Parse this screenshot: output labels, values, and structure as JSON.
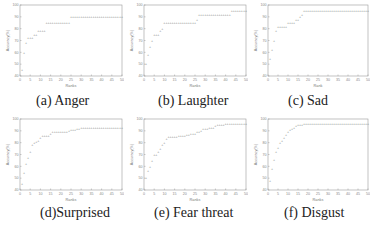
{
  "captions": {
    "a": "(a) Anger",
    "b": "(b) Laughter",
    "c": "(c) Sad",
    "d": "(d)Surprised",
    "e": "(e) Fear threat",
    "f": "(f) Disgust"
  },
  "chart_data": [
    {
      "id": "a",
      "type": "scatter",
      "title": "(a) Anger",
      "xlabel": "Ranks",
      "ylabel": "Accuracy(%)",
      "xlim": [
        0,
        50
      ],
      "ylim": [
        40,
        100
      ],
      "x": [
        1,
        2,
        3,
        4,
        5,
        6,
        7,
        8,
        9,
        10,
        11,
        12,
        13,
        14,
        15,
        16,
        17,
        18,
        19,
        20,
        21,
        22,
        23,
        24,
        25,
        26,
        27,
        28,
        29,
        30,
        31,
        32,
        33,
        34,
        35,
        36,
        37,
        38,
        39,
        40,
        41,
        42,
        43,
        44,
        45,
        46,
        47,
        48,
        49,
        50
      ],
      "values": [
        45,
        60,
        68,
        72,
        72,
        72,
        75,
        75,
        78,
        78,
        78,
        78,
        85,
        85,
        85,
        85,
        85,
        85,
        85,
        85,
        85,
        85,
        85,
        85,
        90,
        90,
        90,
        90,
        90,
        90,
        90,
        90,
        90,
        90,
        90,
        90,
        90,
        90,
        90,
        90,
        90,
        90,
        90,
        90,
        90,
        90,
        90,
        90,
        90,
        90
      ],
      "grid": false
    },
    {
      "id": "b",
      "type": "scatter",
      "title": "(b) Laughter",
      "xlabel": "Ranks",
      "ylabel": "Accuracy(%)",
      "xlim": [
        0,
        50
      ],
      "ylim": [
        40,
        100
      ],
      "x": [
        1,
        2,
        3,
        4,
        5,
        6,
        7,
        8,
        9,
        10,
        11,
        12,
        13,
        14,
        15,
        16,
        17,
        18,
        19,
        20,
        21,
        22,
        23,
        24,
        25,
        26,
        27,
        28,
        29,
        30,
        31,
        32,
        33,
        34,
        35,
        36,
        37,
        38,
        39,
        40,
        41,
        42,
        43,
        44,
        45,
        46,
        47,
        48,
        49,
        50
      ],
      "values": [
        50,
        58,
        65,
        70,
        75,
        75,
        75,
        78,
        80,
        85,
        85,
        85,
        85,
        85,
        85,
        85,
        85,
        85,
        85,
        85,
        85,
        85,
        85,
        85,
        85,
        88,
        92,
        92,
        92,
        92,
        92,
        92,
        92,
        92,
        92,
        92,
        92,
        92,
        92,
        92,
        92,
        92,
        95,
        95,
        95,
        95,
        95,
        95,
        95,
        95
      ],
      "grid": false
    },
    {
      "id": "c",
      "type": "scatter",
      "title": "(c) Sad",
      "xlabel": "Rank",
      "ylabel": "Accuracy(%)",
      "xlim": [
        0,
        50
      ],
      "ylim": [
        40,
        100
      ],
      "x": [
        1,
        2,
        3,
        4,
        5,
        6,
        7,
        8,
        9,
        10,
        11,
        12,
        13,
        14,
        15,
        16,
        17,
        18,
        19,
        20,
        21,
        22,
        23,
        24,
        25,
        26,
        27,
        28,
        29,
        30,
        31,
        32,
        33,
        34,
        35,
        36,
        37,
        38,
        39,
        40,
        41,
        42,
        43,
        44,
        45,
        46,
        47,
        48,
        49,
        50
      ],
      "values": [
        55,
        62,
        70,
        78,
        82,
        82,
        82,
        82,
        82,
        85,
        85,
        85,
        85,
        88,
        88,
        90,
        92,
        95,
        95,
        95,
        95,
        95,
        95,
        95,
        95,
        95,
        95,
        95,
        95,
        95,
        95,
        95,
        95,
        95,
        95,
        95,
        95,
        95,
        95,
        95,
        95,
        95,
        95,
        95,
        95,
        95,
        95,
        95,
        95,
        95
      ],
      "grid": false
    },
    {
      "id": "d",
      "type": "scatter",
      "title": "(d)Surprised",
      "xlabel": "Ranks",
      "ylabel": "Accuracy(%)",
      "xlim": [
        0,
        50
      ],
      "ylim": [
        40,
        100
      ],
      "xticks": [
        0,
        5,
        10,
        15,
        20,
        25,
        30,
        35,
        40,
        45,
        50
      ],
      "yticks": [
        40,
        50,
        60,
        70,
        80,
        90,
        100
      ],
      "x": [
        1,
        2,
        3,
        4,
        5,
        6,
        7,
        8,
        9,
        10,
        11,
        12,
        13,
        14,
        15,
        16,
        17,
        18,
        19,
        20,
        21,
        22,
        23,
        24,
        25,
        26,
        27,
        28,
        29,
        30,
        31,
        32,
        33,
        34,
        35,
        36,
        37,
        38,
        39,
        40,
        41,
        42,
        43,
        44,
        45,
        46,
        47,
        48,
        49,
        50
      ],
      "values": [
        45,
        55,
        62,
        67,
        72,
        78,
        80,
        81,
        82,
        84,
        86,
        86,
        86,
        86,
        88,
        89,
        89,
        89,
        89,
        89,
        89,
        89,
        89,
        90,
        91,
        91,
        91,
        92,
        92,
        93,
        93,
        93,
        93,
        93,
        93,
        93,
        93,
        93,
        93,
        93,
        93,
        93,
        93,
        93,
        93,
        93,
        93,
        93,
        93,
        93
      ],
      "grid": false
    },
    {
      "id": "e",
      "type": "scatter",
      "title": "(e) Fear threat",
      "xlabel": "Ranks",
      "ylabel": "Accuracy(%)",
      "xlim": [
        0,
        50
      ],
      "ylim": [
        40,
        100
      ],
      "x": [
        1,
        2,
        3,
        4,
        5,
        6,
        7,
        8,
        9,
        10,
        11,
        12,
        13,
        14,
        15,
        16,
        17,
        18,
        19,
        20,
        21,
        22,
        23,
        24,
        25,
        26,
        27,
        28,
        29,
        30,
        31,
        32,
        33,
        34,
        35,
        36,
        37,
        38,
        39,
        40,
        41,
        42,
        43,
        44,
        45,
        46,
        47,
        48,
        49,
        50
      ],
      "values": [
        50,
        56,
        60,
        65,
        70,
        70,
        72,
        75,
        78,
        80,
        83,
        85,
        85,
        85,
        85,
        85,
        86,
        86,
        86,
        86,
        87,
        87,
        88,
        88,
        88,
        89,
        89,
        90,
        92,
        92,
        92,
        93,
        93,
        93,
        94,
        95,
        95,
        95,
        95,
        96,
        96,
        96,
        96,
        96,
        96,
        96,
        96,
        96,
        96,
        96
      ],
      "grid": false
    },
    {
      "id": "f",
      "type": "scatter",
      "title": "(f) Disgust",
      "xlabel": "Ranks",
      "ylabel": "Accuracy(%)",
      "xlim": [
        0,
        50
      ],
      "ylim": [
        40,
        100
      ],
      "x": [
        1,
        2,
        3,
        4,
        5,
        6,
        7,
        8,
        9,
        10,
        11,
        12,
        13,
        14,
        15,
        16,
        17,
        18,
        19,
        20,
        21,
        22,
        23,
        24,
        25,
        26,
        27,
        28,
        29,
        30,
        31,
        32,
        33,
        34,
        35,
        36,
        37,
        38,
        39,
        40,
        41,
        42,
        43,
        44,
        45,
        46,
        47,
        48,
        49,
        50
      ],
      "values": [
        48,
        58,
        66,
        72,
        76,
        80,
        82,
        84,
        87,
        89,
        91,
        92,
        93,
        94,
        95,
        95,
        95,
        96,
        96,
        96,
        96,
        96,
        96,
        96,
        96,
        96,
        96,
        96,
        96,
        96,
        96,
        96,
        96,
        96,
        96,
        96,
        96,
        96,
        96,
        96,
        96,
        96,
        96,
        96,
        96,
        96,
        96,
        96,
        96,
        96
      ],
      "grid": false
    }
  ]
}
